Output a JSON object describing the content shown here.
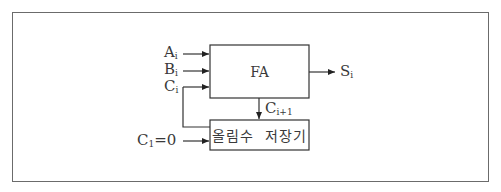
{
  "diagram": {
    "fa_block": {
      "label": "FA"
    },
    "register_block": {
      "label": "올림수  저장기"
    },
    "inputs": {
      "a": {
        "base": "A",
        "sub": "i"
      },
      "b": {
        "base": "B",
        "sub": "i"
      },
      "c": {
        "base": "C",
        "sub": "i"
      }
    },
    "output_sum": {
      "base": "S",
      "sub": "i"
    },
    "carry_out": {
      "base": "C",
      "sub": "i+1"
    },
    "initial_carry": {
      "base": "C",
      "sub": "1",
      "suffix": "=0"
    },
    "colors": {
      "line": "#333333",
      "frame": "#6b6b6b",
      "text": "#3a3a3a"
    }
  }
}
